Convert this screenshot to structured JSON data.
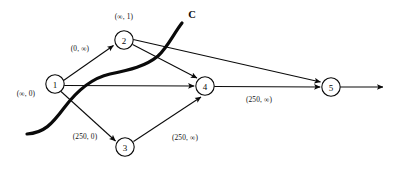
{
  "figure": {
    "kind": "network-flow-graph-with-cut",
    "background_color": "#ffffff",
    "ink_color": "#0a0a0a",
    "width": 394,
    "height": 176
  },
  "nodes": [
    {
      "id": "1",
      "label": "1",
      "cx": 55,
      "cy": 84,
      "r": 9.2
    },
    {
      "id": "2",
      "label": "2",
      "cx": 124,
      "cy": 40,
      "r": 9.2
    },
    {
      "id": "3",
      "label": "3",
      "cx": 125,
      "cy": 147,
      "r": 9.2
    },
    {
      "id": "4",
      "label": "4",
      "cx": 205,
      "cy": 86,
      "r": 9.2
    },
    {
      "id": "5",
      "label": "5",
      "cx": 331,
      "cy": 87,
      "r": 9.2
    }
  ],
  "node_labels": [
    {
      "name": "node-1-annotation",
      "text": "(∞, 0)",
      "x": 26,
      "y": 93
    },
    {
      "name": "node-2-annotation",
      "text": "(∞, 1)",
      "x": 124,
      "y": 16
    }
  ],
  "edges": [
    {
      "id": "e1-2",
      "from": "1",
      "to": "2",
      "label": "(0, ∞)",
      "label_x": 80,
      "label_y": 48
    },
    {
      "id": "e1-3",
      "from": "1",
      "to": "3",
      "label": "(250, 0)",
      "label_x": 85,
      "label_y": 136
    },
    {
      "id": "e1-4",
      "from": "1",
      "to": "4",
      "label": "",
      "label_x": 0,
      "label_y": 0
    },
    {
      "id": "e2-4",
      "from": "2",
      "to": "4",
      "label": "",
      "label_x": 0,
      "label_y": 0
    },
    {
      "id": "e2-5",
      "from": "2",
      "to": "5",
      "label": "",
      "label_x": 0,
      "label_y": 0
    },
    {
      "id": "e3-4",
      "from": "3",
      "to": "4",
      "label": "(250, ∞)",
      "label_x": 185,
      "label_y": 137
    },
    {
      "id": "e4-5",
      "from": "4",
      "to": "5",
      "label": "(250, ∞)",
      "label_x": 259,
      "label_y": 99
    },
    {
      "id": "e5-sink",
      "from": "5",
      "to": "sink",
      "label": "",
      "label_x": 0,
      "label_y": 0
    }
  ],
  "cut": {
    "name": "cut-C",
    "label": "C",
    "label_x": 192,
    "label_y": 14,
    "start_x": 27,
    "start_y": 134,
    "end_x": 182,
    "end_y": 23
  }
}
